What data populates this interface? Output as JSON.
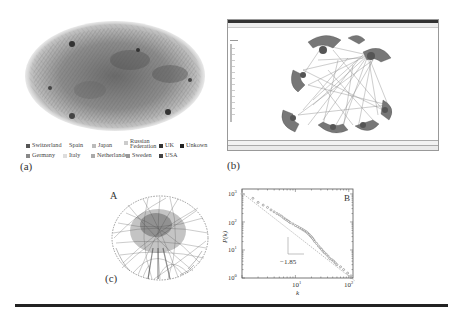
{
  "figure": {
    "panels": {
      "a": {
        "label": "(a)",
        "description": "Internet AS-level network graph colored by country"
      },
      "b": {
        "label": "(b)",
        "description": "Network visualization software window"
      },
      "c": {
        "label": "(c)",
        "subpanel_A_label": "A",
        "subpanel_B_label": "B"
      }
    },
    "legend": {
      "items": [
        {
          "label": "Switzerland",
          "color": "#555555"
        },
        {
          "label": "Spain",
          "color": "#ffffff"
        },
        {
          "label": "Japan",
          "color": "#bbbbbb"
        },
        {
          "label": "Russian Federation",
          "color": "#cccccc"
        },
        {
          "label": "UK",
          "color": "#333333"
        },
        {
          "label": "Unkown",
          "color": "#222222"
        },
        {
          "label": "Germany",
          "color": "#888888"
        },
        {
          "label": "Italy",
          "color": "#dddddd"
        },
        {
          "label": "Netherlands",
          "color": "#aaaaaa"
        },
        {
          "label": "Sweden",
          "color": "#999999"
        },
        {
          "label": "USA",
          "color": "#444444"
        }
      ]
    }
  },
  "chart_data": {
    "type": "scatter",
    "title": "",
    "panel_label": "B",
    "xlabel": "k",
    "ylabel": "P(k)",
    "xscale": "log",
    "yscale": "log",
    "xlim": [
      1,
      120
    ],
    "ylim": [
      1,
      1500
    ],
    "x_ticks": [
      "10^1",
      "10^2"
    ],
    "y_ticks": [
      "10^0",
      "10^1",
      "10^2",
      "10^3"
    ],
    "annotation": "-1.85",
    "fit_slope": -1.85,
    "series": [
      {
        "name": "degree distribution",
        "x": [
          1,
          1.6,
          2,
          2.5,
          3,
          3.5,
          4,
          4.5,
          5,
          5.5,
          6,
          6.5,
          7,
          7.5,
          8,
          9,
          10,
          11,
          12,
          13,
          14,
          15,
          16,
          17,
          18,
          19,
          20,
          21,
          22,
          23,
          25,
          27,
          29,
          31,
          33,
          35,
          38,
          41,
          44,
          48,
          52,
          56,
          60,
          70,
          80,
          95,
          110
        ],
        "y": [
          1000,
          700,
          500,
          400,
          330,
          270,
          230,
          200,
          180,
          160,
          140,
          125,
          115,
          105,
          95,
          85,
          75,
          68,
          62,
          57,
          52,
          48,
          44,
          40,
          36,
          32,
          29,
          26,
          23,
          20,
          17,
          14,
          12,
          10.5,
          9,
          8,
          7,
          6,
          5,
          4.5,
          4,
          3.5,
          3,
          2.5,
          2,
          1.5,
          1.2
        ]
      }
    ],
    "legend": null,
    "grid": false
  },
  "labels": {
    "a": "(a)",
    "b": "(b)",
    "c": "(c)",
    "A": "A",
    "B": "B",
    "slope": "−1.85",
    "xaxis": "k",
    "yaxis": "P(k)",
    "x10_1": "10",
    "x10_2": "10",
    "sup1": "1",
    "sup2": "2",
    "y0": "10",
    "y1": "10",
    "y2": "10",
    "y3": "10",
    "sup0": "0",
    "sup3": "3"
  }
}
